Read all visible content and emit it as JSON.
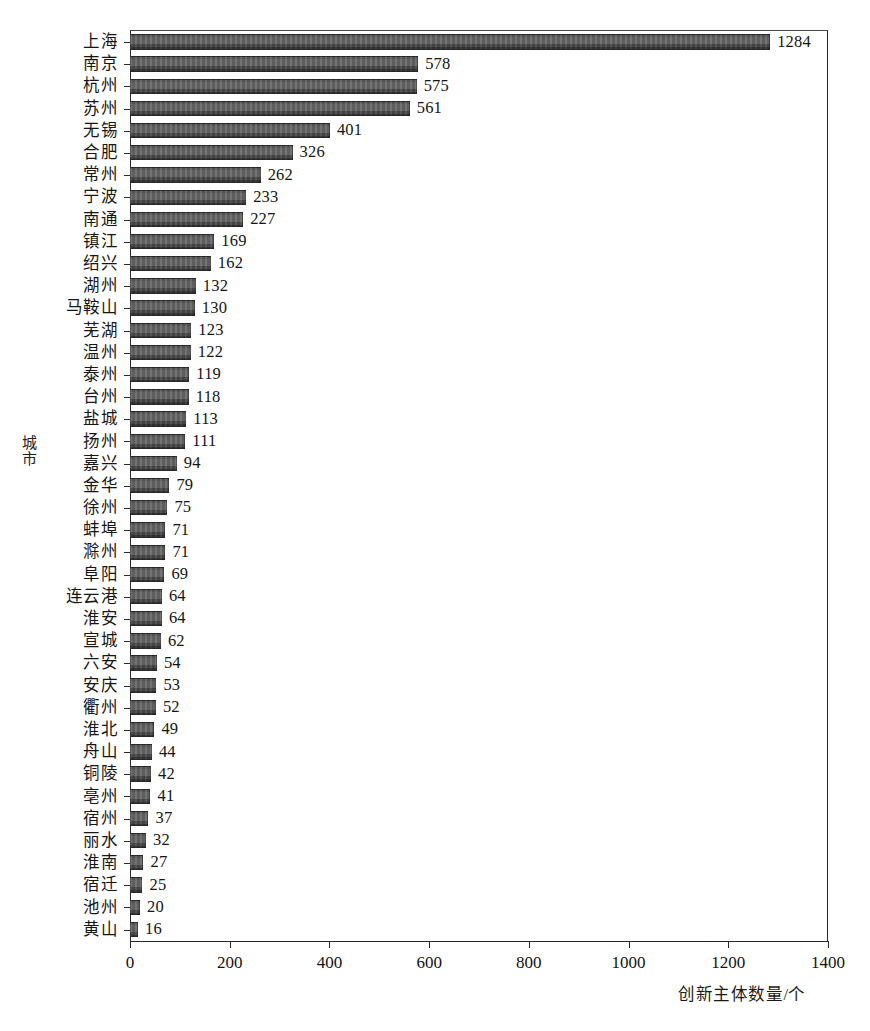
{
  "chart_data": {
    "type": "bar",
    "orientation": "horizontal",
    "title": "",
    "xlabel": "创新主体数量/个",
    "ylabel": "城市",
    "xlim": [
      0,
      1400
    ],
    "xticks": [
      0,
      200,
      400,
      600,
      800,
      1000,
      1200,
      1400
    ],
    "grid": false,
    "legend": null,
    "bar_color": "#575757",
    "categories": [
      "上海",
      "南京",
      "杭州",
      "苏州",
      "无锡",
      "合肥",
      "常州",
      "宁波",
      "南通",
      "镇江",
      "绍兴",
      "湖州",
      "马鞍山",
      "芜湖",
      "温州",
      "泰州",
      "台州",
      "盐城",
      "扬州",
      "嘉兴",
      "金华",
      "徐州",
      "蚌埠",
      "滁州",
      "阜阳",
      "连云港",
      "淮安",
      "宣城",
      "六安",
      "安庆",
      "衢州",
      "淮北",
      "舟山",
      "铜陵",
      "亳州",
      "宿州",
      "丽水",
      "淮南",
      "宿迁",
      "池州",
      "黄山"
    ],
    "values": [
      1284,
      578,
      575,
      561,
      401,
      326,
      262,
      233,
      227,
      169,
      162,
      132,
      130,
      123,
      122,
      119,
      118,
      113,
      111,
      94,
      79,
      75,
      71,
      71,
      69,
      64,
      64,
      62,
      54,
      53,
      52,
      49,
      44,
      42,
      41,
      37,
      32,
      27,
      25,
      20,
      16
    ],
    "value_labels": [
      "1284",
      "578",
      "575",
      "561",
      "401",
      "326",
      "262",
      "233",
      "227",
      "169",
      "162",
      "132",
      "130",
      "123",
      "122",
      "119",
      "118",
      "113",
      "111",
      "94",
      "79",
      "75",
      "71",
      "71",
      "69",
      "64",
      "64",
      "62",
      "54",
      "53",
      "52",
      "49",
      "44",
      "42",
      "41",
      "37",
      "32",
      "27",
      "25",
      "20",
      "16"
    ]
  }
}
